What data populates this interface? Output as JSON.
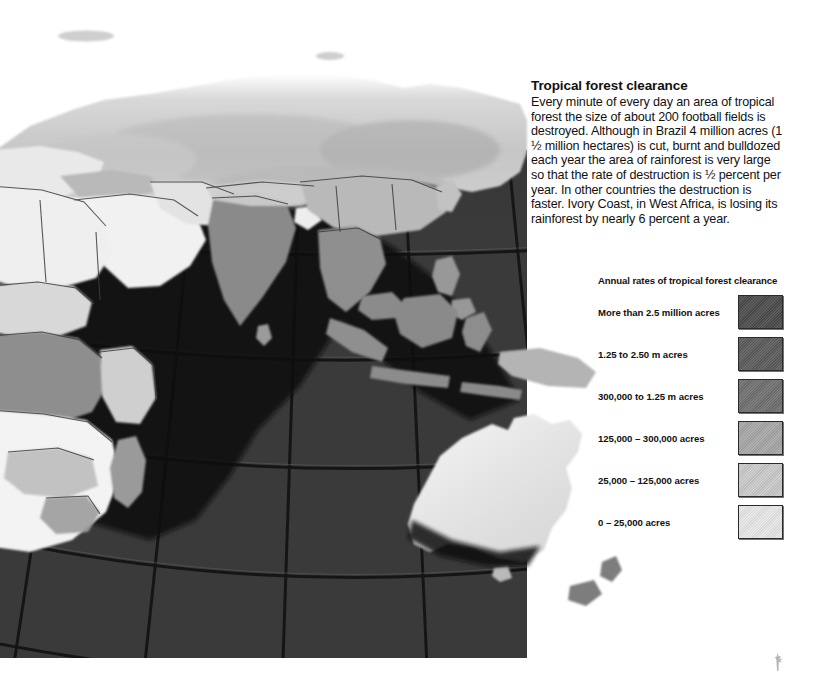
{
  "article": {
    "title": "Tropical forest clearance",
    "body": "Every minute of every day an area of tropical forest the size of about 200 football fields is destroyed. Although in Brazil 4 million acres (1 ½ million hectares) is cut, burnt and bulldozed each year the area of rainforest is very large so that the rate of destruction is ½ percent per year. In other countries the destruction is faster. Ivory Coast, in West Africa, is losing its rainforest by nearly 6 percent a year."
  },
  "legend": {
    "title": "Annual rates of tropical forest clearance",
    "items": [
      {
        "label": "More than 2.5 million acres",
        "color": "#4b4b4b"
      },
      {
        "label": "1.25 to 2.50 m acres",
        "color": "#5b5b5b"
      },
      {
        "label": "300,000 to 1.25 m acres",
        "color": "#6f6f6f"
      },
      {
        "label": "125,000 – 300,000 acres",
        "color": "#a6a6a6"
      },
      {
        "label": "25,000 – 125,000 acres",
        "color": "#c9c9c9"
      },
      {
        "label": "0 – 25,000 acres",
        "color": "#e6e6e6"
      }
    ]
  },
  "map": {
    "title": "World map of tropical forest clearance",
    "projection": "globe",
    "ocean_color": "#3a3a3a",
    "graticule_color": "#1b1b1b",
    "regions": [
      {
        "name": "Siberia / northern Asia",
        "color": "#c7c7c7"
      },
      {
        "name": "Europe",
        "color": "#e8e8e8"
      },
      {
        "name": "North Africa",
        "color": "#efefef"
      },
      {
        "name": "West Africa",
        "color": "#d9d9d9"
      },
      {
        "name": "Central Africa",
        "color": "#8e8e8e"
      },
      {
        "name": "Southern Africa",
        "color": "#f2f2f2"
      },
      {
        "name": "Madagascar",
        "color": "#9a9a9a"
      },
      {
        "name": "Arabia",
        "color": "#f0f0f0"
      },
      {
        "name": "India",
        "color": "#8a8a8a"
      },
      {
        "name": "Indochina",
        "color": "#8f8f8f"
      },
      {
        "name": "Indonesia",
        "color": "#8a8a8a"
      },
      {
        "name": "Philippines",
        "color": "#989898"
      },
      {
        "name": "New Guinea",
        "color": "#b4b4b4"
      },
      {
        "name": "Australia",
        "color": "#e4e4e4"
      },
      {
        "name": "New Zealand",
        "color": "#7d7d7d"
      }
    ]
  }
}
